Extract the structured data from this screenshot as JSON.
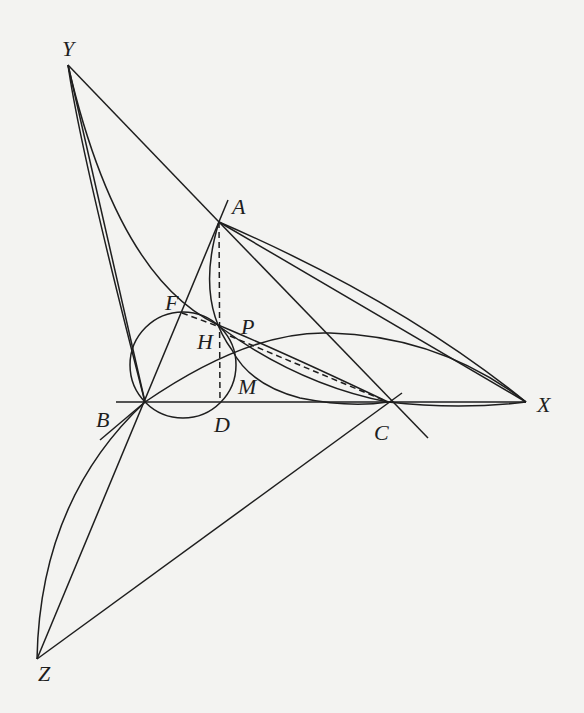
{
  "diagram": {
    "points": {
      "Y": {
        "label": "Y",
        "x": 68,
        "y": 65,
        "lx": 62,
        "ly": 56
      },
      "A": {
        "label": "A",
        "x": 219,
        "y": 222,
        "lx": 232,
        "ly": 214
      },
      "B": {
        "label": "B",
        "x": 145,
        "y": 402,
        "lx": 96,
        "ly": 427
      },
      "C": {
        "label": "C",
        "x": 388,
        "y": 402,
        "lx": 374,
        "ly": 440
      },
      "D": {
        "label": "D",
        "x": 220,
        "y": 402,
        "lx": 214,
        "ly": 432
      },
      "X": {
        "label": "X",
        "x": 526,
        "y": 402,
        "lx": 537,
        "ly": 412
      },
      "Z": {
        "label": "Z",
        "x": 37,
        "y": 659,
        "lx": 38,
        "ly": 681
      },
      "H": {
        "label": "H",
        "x": 220,
        "y": 327,
        "lx": 197,
        "ly": 349
      },
      "P": {
        "label": "P",
        "x": 230,
        "y": 330,
        "lx": 241,
        "ly": 334
      },
      "F": {
        "label": "F",
        "x": 182,
        "y": 313,
        "lx": 165,
        "ly": 310
      },
      "M": {
        "label": "M",
        "x": 236,
        "y": 380,
        "lx": 238,
        "ly": 394
      }
    },
    "segments": [
      {
        "name": "segment-YA",
        "d": "M68,65 L219,222"
      },
      {
        "name": "segment-YB",
        "d": "M68,65 L145,402"
      },
      {
        "name": "segment-AX",
        "d": "M219,222 L526,402"
      },
      {
        "name": "segment-A-C-line",
        "d": "M219,222 L428,438"
      },
      {
        "name": "segment-BX",
        "d": "M116,402 L526,402"
      },
      {
        "name": "segment-ZB-extended",
        "d": "M37,659 L228,200"
      },
      {
        "name": "segment-ZC",
        "d": "M37,659 L402,393"
      },
      {
        "name": "segment-BZ-lower",
        "d": "M145,402 L100,440"
      }
    ],
    "dashed": [
      {
        "name": "altitude-AD",
        "d": "M219,222 L220,402"
      },
      {
        "name": "dashed-FH",
        "d": "M182,313 L220,327"
      },
      {
        "name": "dashed-PC",
        "d": "M230,336 L388,402"
      }
    ],
    "curves": [
      {
        "name": "arc-Y-to-C",
        "d": "M68,65 Q120,290 230,330 Q300,360 388,402"
      },
      {
        "name": "arc-Y-to-B-inner",
        "d": "M68,65 Q80,150 145,402"
      },
      {
        "name": "arc-A-to-M",
        "d": "M219,222 Q195,300 232,350 Q250,385 300,398 Q350,408 388,402"
      },
      {
        "name": "arc-B-to-X-upper",
        "d": "M145,402 Q250,330 330,333 Q440,336 526,402"
      },
      {
        "name": "arc-A-to-X",
        "d": "M219,222 Q400,300 526,402"
      },
      {
        "name": "arc-H-to-C",
        "d": "M220,327 Q300,385 388,402"
      },
      {
        "name": "arc-C-to-X-lower",
        "d": "M388,402 Q460,410 526,402"
      },
      {
        "name": "arc-B-to-Z",
        "d": "M145,402 Q40,500 37,659"
      }
    ],
    "circle": {
      "name": "circle-BDHF",
      "cx": 183,
      "cy": 365,
      "r": 53
    }
  }
}
